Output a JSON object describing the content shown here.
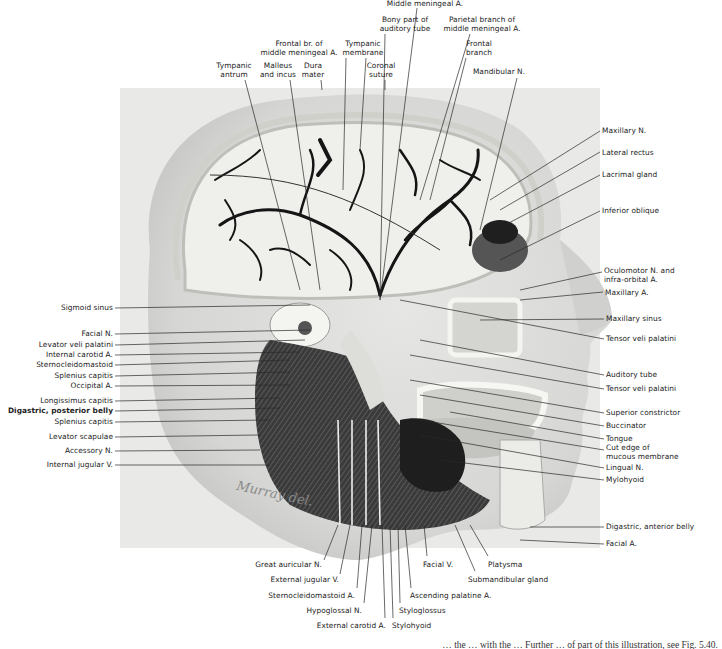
{
  "figure": {
    "type": "anatomical-illustration",
    "signature": "Murray del.",
    "caption_partial": "… the … with the … Further … of part of this illustration, see Fig. 5.40."
  },
  "labels": {
    "top": [
      {
        "id": "middle-meningeal-a",
        "text": "Middle meningeal A.",
        "x": 425,
        "y": 0
      },
      {
        "id": "bony-part-auditory-tube",
        "text": "Bony part of\nauditory tube",
        "x": 405,
        "y": 16
      },
      {
        "id": "parietal-branch",
        "text": "Parietal branch of\nmiddle meningeal A.",
        "x": 482,
        "y": 16
      },
      {
        "id": "frontal-br-middle-meningeal",
        "text": "Frontal br. of\nmiddle meningeal A.",
        "x": 299,
        "y": 40
      },
      {
        "id": "tympanic-membrane",
        "text": "Tympanic\nmembrane",
        "x": 363,
        "y": 40
      },
      {
        "id": "frontal-branch",
        "text": "Frontal\nbranch",
        "x": 479,
        "y": 40
      },
      {
        "id": "tympanic-antrum",
        "text": "Tympanic\nantrum",
        "x": 234,
        "y": 62
      },
      {
        "id": "malleus-and-incus",
        "text": "Malleus\nand incus",
        "x": 278,
        "y": 62
      },
      {
        "id": "dura-mater",
        "text": "Dura\nmater",
        "x": 313,
        "y": 62
      },
      {
        "id": "coronal-suture",
        "text": "Coronal\nsuture",
        "x": 381,
        "y": 62
      },
      {
        "id": "mandibular-n",
        "text": "Mandibular N.",
        "x": 499,
        "y": 68
      }
    ],
    "right": [
      {
        "id": "maxillary-n",
        "text": "Maxillary N.",
        "x": 602,
        "y": 127
      },
      {
        "id": "lateral-rectus",
        "text": "Lateral rectus",
        "x": 602,
        "y": 149
      },
      {
        "id": "lacrimal-gland",
        "text": "Lacrimal gland",
        "x": 602,
        "y": 171
      },
      {
        "id": "inferior-oblique",
        "text": "Inferior oblique",
        "x": 602,
        "y": 207
      },
      {
        "id": "oculomotor-n",
        "text": "Oculomotor N. and\ninfra-orbital A.",
        "x": 604,
        "y": 267
      },
      {
        "id": "maxillary-a",
        "text": "Maxillary A.",
        "x": 605,
        "y": 289
      },
      {
        "id": "maxillary-sinus",
        "text": "Maxillary sinus",
        "x": 606,
        "y": 315
      },
      {
        "id": "tensor-veli-palatini-1",
        "text": "Tensor veli palatini",
        "x": 606,
        "y": 335
      },
      {
        "id": "auditory-tube",
        "text": "Auditory tube",
        "x": 606,
        "y": 371
      },
      {
        "id": "tensor-veli-palatini-2",
        "text": "Tensor veli palatini",
        "x": 606,
        "y": 385
      },
      {
        "id": "superior-constrictor",
        "text": "Superior constrictor",
        "x": 606,
        "y": 409
      },
      {
        "id": "buccinator",
        "text": "Buccinator",
        "x": 606,
        "y": 422
      },
      {
        "id": "tongue",
        "text": "Tongue",
        "x": 606,
        "y": 435
      },
      {
        "id": "cut-edge-mucous",
        "text": "Cut edge of\nmucous membrane",
        "x": 606,
        "y": 444
      },
      {
        "id": "lingual-n",
        "text": "Lingual N.",
        "x": 606,
        "y": 464
      },
      {
        "id": "mylohyoid",
        "text": "Mylohyoid",
        "x": 606,
        "y": 476
      },
      {
        "id": "digastric-anterior",
        "text": "Digastric, anterior belly",
        "x": 606,
        "y": 523
      },
      {
        "id": "facial-a",
        "text": "Facial A.",
        "x": 606,
        "y": 540
      }
    ],
    "left": [
      {
        "id": "sigmoid-sinus",
        "text": "Sigmoid sinus",
        "x": 113,
        "y": 304
      },
      {
        "id": "facial-n",
        "text": "Facial N.",
        "x": 113,
        "y": 330
      },
      {
        "id": "levator-veli-palatini",
        "text": "Levator veli palatini",
        "x": 113,
        "y": 341
      },
      {
        "id": "internal-carotid-a",
        "text": "Internal carotid A.",
        "x": 113,
        "y": 351
      },
      {
        "id": "sternocleidomastoid",
        "text": "Sternocleidomastoid",
        "x": 113,
        "y": 361
      },
      {
        "id": "splenius-capitis-1",
        "text": "Splenius capitis",
        "x": 113,
        "y": 372
      },
      {
        "id": "occipital-a",
        "text": "Occipital A.",
        "x": 113,
        "y": 382
      },
      {
        "id": "longissimus-capitis",
        "text": "Longissimus capitis",
        "x": 113,
        "y": 397
      },
      {
        "id": "digastric-posterior",
        "text": "Digastric, posterior belly",
        "x": 113,
        "y": 407,
        "bold": true
      },
      {
        "id": "splenius-capitis-2",
        "text": "Splenius capitis",
        "x": 113,
        "y": 418
      },
      {
        "id": "levator-scapulae",
        "text": "Levator scapulae",
        "x": 113,
        "y": 433
      },
      {
        "id": "accessory-n",
        "text": "Accessory N.",
        "x": 113,
        "y": 447
      },
      {
        "id": "internal-jugular-v",
        "text": "Internal jugular V.",
        "x": 113,
        "y": 461
      }
    ],
    "bottom": [
      {
        "id": "great-auricular-n",
        "text": "Great auricular N.",
        "x": 322,
        "y": 561,
        "align": "r"
      },
      {
        "id": "external-jugular-v",
        "text": "External jugular V.",
        "x": 339,
        "y": 576,
        "align": "r"
      },
      {
        "id": "sternocleidomastoid-a",
        "text": "Sternocleidomastoid A.",
        "x": 355,
        "y": 592,
        "align": "r"
      },
      {
        "id": "hypoglossal-n",
        "text": "Hypoglossal N.",
        "x": 362,
        "y": 607,
        "align": "r"
      },
      {
        "id": "external-carotid-a",
        "text": "External carotid A.",
        "x": 386,
        "y": 622,
        "align": "r"
      },
      {
        "id": "stylohyoid",
        "text": "Stylohyoid",
        "x": 392,
        "y": 622,
        "align": "l"
      },
      {
        "id": "styloglossus",
        "text": "Styloglossus",
        "x": 399,
        "y": 607,
        "align": "l"
      },
      {
        "id": "ascending-palatine-a",
        "text": "Ascending palatine A.",
        "x": 410,
        "y": 592,
        "align": "l"
      },
      {
        "id": "facial-v",
        "text": "Facial V.",
        "x": 423,
        "y": 561,
        "align": "l"
      },
      {
        "id": "platysma",
        "text": "Platysma",
        "x": 488,
        "y": 561,
        "align": "l"
      },
      {
        "id": "submandibular-gland",
        "text": "Submandibular gland",
        "x": 468,
        "y": 576,
        "align": "l"
      }
    ]
  },
  "leaders": [
    [
      417,
      8,
      380,
      300
    ],
    [
      385,
      34,
      380,
      300
    ],
    [
      470,
      34,
      420,
      200
    ],
    [
      346,
      58,
      343,
      190
    ],
    [
      366,
      58,
      360,
      150
    ],
    [
      466,
      58,
      430,
      200
    ],
    [
      245,
      80,
      300,
      290
    ],
    [
      290,
      80,
      320,
      290
    ],
    [
      321,
      80,
      322,
      90
    ],
    [
      385,
      80,
      385,
      90
    ],
    [
      517,
      78,
      480,
      230
    ],
    [
      600,
      131,
      490,
      200
    ],
    [
      600,
      152,
      500,
      210
    ],
    [
      600,
      175,
      505,
      225
    ],
    [
      600,
      211,
      500,
      260
    ],
    [
      602,
      272,
      520,
      290
    ],
    [
      603,
      292,
      520,
      300
    ],
    [
      604,
      319,
      480,
      320
    ],
    [
      604,
      339,
      400,
      300
    ],
    [
      604,
      375,
      420,
      340
    ],
    [
      604,
      389,
      410,
      355
    ],
    [
      604,
      413,
      410,
      380
    ],
    [
      604,
      426,
      420,
      395
    ],
    [
      604,
      439,
      450,
      412
    ],
    [
      604,
      450,
      420,
      420
    ],
    [
      604,
      468,
      420,
      435
    ],
    [
      604,
      480,
      440,
      460
    ],
    [
      604,
      527,
      530,
      527
    ],
    [
      604,
      544,
      520,
      540
    ],
    [
      115,
      308,
      310,
      305
    ],
    [
      115,
      334,
      310,
      330
    ],
    [
      115,
      345,
      305,
      340
    ],
    [
      115,
      355,
      300,
      352
    ],
    [
      115,
      365,
      290,
      360
    ],
    [
      115,
      376,
      290,
      372
    ],
    [
      115,
      386,
      290,
      385
    ],
    [
      115,
      401,
      280,
      398
    ],
    [
      115,
      411,
      280,
      408
    ],
    [
      115,
      422,
      270,
      420
    ],
    [
      115,
      437,
      260,
      435
    ],
    [
      115,
      451,
      260,
      450
    ],
    [
      115,
      465,
      270,
      465
    ],
    [
      324,
      560,
      338,
      525
    ],
    [
      340,
      574,
      350,
      525
    ],
    [
      357,
      588,
      362,
      525
    ],
    [
      364,
      603,
      372,
      525
    ],
    [
      385,
      618,
      382,
      525
    ],
    [
      393,
      618,
      390,
      525
    ],
    [
      400,
      603,
      398,
      525
    ],
    [
      411,
      588,
      405,
      525
    ],
    [
      427,
      556,
      424,
      525
    ],
    [
      488,
      556,
      470,
      525
    ],
    [
      475,
      571,
      455,
      525
    ]
  ],
  "colors": {
    "background": "#ffffff",
    "text": "#222222",
    "leader": "#2a2a2a",
    "skin": "#dcdcdc",
    "skin_shadow": "#c6c6c6",
    "dura": "#eeeeea",
    "vessel": "#151515",
    "muscle_dark": "#3a3a3a",
    "bone": "#f2f2ee"
  }
}
